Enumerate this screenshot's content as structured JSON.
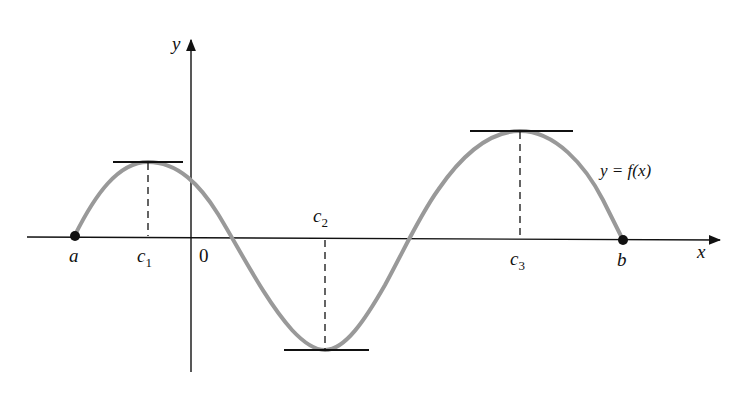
{
  "figure": {
    "axes": {
      "x_label": "x",
      "y_label": "y",
      "origin_label": "0"
    },
    "curve_label": "y = f(x)",
    "curve_color": "#999999",
    "axis_color": "#111111",
    "points": {
      "a": {
        "label": "a"
      },
      "b": {
        "label": "b"
      }
    },
    "critical_points": [
      {
        "label": "c",
        "subscript": "1",
        "type": "local max"
      },
      {
        "label": "c",
        "subscript": "2",
        "type": "local min"
      },
      {
        "label": "c",
        "subscript": "3",
        "type": "absolute max"
      }
    ]
  }
}
